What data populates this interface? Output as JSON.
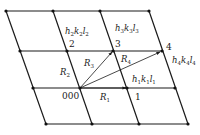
{
  "diagram": {
    "type": "crystal-lattice-vectors",
    "lattice": {
      "rows": [
        {
          "y": 11,
          "x": [
            6,
            53,
            100,
            149
          ]
        },
        {
          "y": 51,
          "x": [
            20,
            67,
            113,
            162
          ]
        },
        {
          "y": 88,
          "x": [
            33,
            80,
            127,
            175
          ]
        },
        {
          "y": 124,
          "x": [
            46,
            92,
            139,
            188
          ]
        }
      ]
    },
    "points": {
      "origin": {
        "label": "000",
        "x": 80,
        "y": 88
      },
      "p1": {
        "label": "1",
        "x": 127,
        "y": 88,
        "plane": {
          "h": "h",
          "k": "k",
          "l": "l",
          "sub": "1"
        }
      },
      "p2": {
        "label": "2",
        "x": 67,
        "y": 51,
        "plane": {
          "h": "h",
          "k": "k",
          "l": "l",
          "sub": "2"
        }
      },
      "p3": {
        "label": "3",
        "x": 113,
        "y": 51,
        "plane": {
          "h": "h",
          "k": "k",
          "l": "l",
          "sub": "3"
        }
      },
      "p4": {
        "label": "4",
        "x": 162,
        "y": 51,
        "plane": {
          "h": "h",
          "k": "k",
          "l": "l",
          "sub": "4"
        }
      }
    },
    "vectors": [
      {
        "name": "R",
        "sub": "1",
        "from": "origin",
        "to": "p1"
      },
      {
        "name": "R",
        "sub": "2",
        "from": "origin",
        "to": "p2"
      },
      {
        "name": "R",
        "sub": "3",
        "from": "origin",
        "to": "p3"
      },
      {
        "name": "R",
        "sub": "4",
        "from": "origin",
        "to": "p4"
      }
    ],
    "labels": {
      "origin": "000",
      "p1": "1",
      "p2": "2",
      "p3": "3",
      "p4": "4",
      "R": "R",
      "r1_sub": "1",
      "r2_sub": "2",
      "r3_sub": "3",
      "r4_sub": "4",
      "h": "h",
      "k": "k",
      "l": "l",
      "hkl1_sub": "1",
      "hkl2_sub": "2",
      "hkl3_sub": "3",
      "hkl4_sub": "4"
    }
  }
}
